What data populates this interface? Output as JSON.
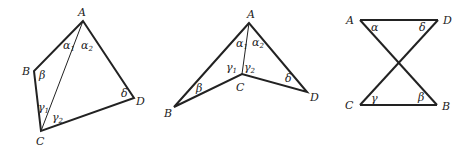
{
  "figures": [
    {
      "id": "convex-quadrilateral",
      "vertices": {
        "A": "A",
        "B": "B",
        "C": "C",
        "D": "D"
      },
      "angles": {
        "alpha1": "α",
        "alpha2": "α",
        "beta": "β",
        "gamma1": "γ",
        "gamma2": "γ",
        "delta": "δ"
      },
      "subscripts": {
        "one": "1",
        "two": "2"
      },
      "diagonal": "AC"
    },
    {
      "id": "concave-quadrilateral",
      "vertices": {
        "A": "A",
        "B": "B",
        "C": "C",
        "D": "D"
      },
      "angles": {
        "alpha1": "α",
        "alpha2": "α",
        "beta": "β",
        "gamma1": "γ",
        "gamma2": "γ",
        "delta": "δ"
      },
      "subscripts": {
        "one": "1",
        "two": "2"
      },
      "diagonal": "AC"
    },
    {
      "id": "crossed-quadrilateral",
      "vertices": {
        "A": "A",
        "B": "B",
        "C": "C",
        "D": "D"
      },
      "angles": {
        "alpha": "α",
        "beta": "β",
        "gamma": "γ",
        "delta": "δ"
      }
    }
  ],
  "colors": {
    "stroke": "#222222",
    "background": "#ffffff"
  }
}
